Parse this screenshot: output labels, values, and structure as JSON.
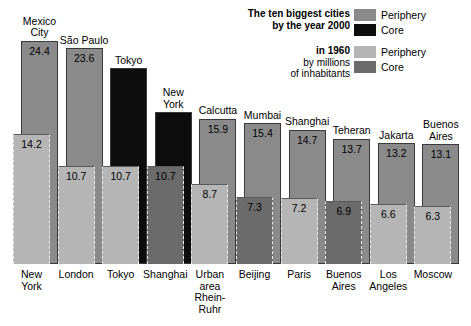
{
  "legend": {
    "title_2000_line1": "The ten biggest cities",
    "title_2000_line2": "by the year 2000",
    "title_1960_line1": "in 1960",
    "title_1960_line2": "by millions",
    "title_1960_line3": "of inhabitants",
    "periphery_2000_label": "Periphery",
    "core_2000_label": "Core",
    "periphery_1960_label": "Periphery",
    "core_1960_label": "Core",
    "colors": {
      "periphery_2000": "#8a8a8a",
      "core_2000": "#0d0d0d",
      "periphery_1960": "#b5b5b5",
      "core_1960": "#6b6b6b"
    }
  },
  "chart_data": {
    "type": "bar",
    "xlabel": "",
    "ylabel": "millions of inhabitants",
    "ylim": [
      0,
      25
    ],
    "grid": false,
    "legend_position": "top-right",
    "series": [
      {
        "name": "2000",
        "categories": [
          "Mexico City",
          "São Paulo",
          "Tokyo",
          "New York",
          "Calcutta",
          "Mumbai",
          "Shanghai",
          "Teheran",
          "Jakarta",
          "Buenos Aires"
        ],
        "values": [
          24.4,
          23.6,
          21.4,
          16.6,
          15.9,
          15.4,
          14.7,
          13.7,
          13.2,
          13.1
        ],
        "types": [
          "periphery",
          "periphery",
          "core",
          "core",
          "periphery",
          "periphery",
          "periphery",
          "periphery",
          "periphery",
          "periphery"
        ]
      },
      {
        "name": "1960",
        "categories": [
          "New York",
          "London",
          "Tokyo",
          "Shanghai",
          "Urban area Rhein-Ruhr",
          "Beijing",
          "Paris",
          "Buenos Aires",
          "Los Angeles",
          "Moscow"
        ],
        "values": [
          14.2,
          10.7,
          10.7,
          10.7,
          8.7,
          7.3,
          7.2,
          6.9,
          6.6,
          6.3
        ],
        "types": [
          "periphery",
          "periphery",
          "periphery",
          "core",
          "periphery",
          "core",
          "periphery",
          "core",
          "periphery",
          "periphery"
        ]
      }
    ],
    "columns": [
      {
        "top_city_line1": "Mexico",
        "top_city_line2": "City",
        "top_value": "24.4",
        "top_type": "periphery",
        "bottom_city_line1": "New",
        "bottom_city_line2": "York",
        "bottom_city_line3": "",
        "bottom_value": "14.2",
        "bottom_type": "periphery"
      },
      {
        "top_city_line1": "São Paulo",
        "top_city_line2": "",
        "top_value": "23.6",
        "top_type": "periphery",
        "bottom_city_line1": "London",
        "bottom_city_line2": "",
        "bottom_city_line3": "",
        "bottom_value": "10.7",
        "bottom_type": "periphery"
      },
      {
        "top_city_line1": "Tokyo",
        "top_city_line2": "",
        "top_value": "",
        "top_type": "core",
        "bottom_city_line1": "Tokyo",
        "bottom_city_line2": "",
        "bottom_city_line3": "",
        "bottom_value": "10.7",
        "bottom_type": "periphery"
      },
      {
        "top_city_line1": "New",
        "top_city_line2": "York",
        "top_value": "",
        "top_type": "core",
        "bottom_city_line1": "Shanghai",
        "bottom_city_line2": "",
        "bottom_city_line3": "",
        "bottom_value": "10.7",
        "bottom_type": "core"
      },
      {
        "top_city_line1": "Calcutta",
        "top_city_line2": "",
        "top_value": "15.9",
        "top_type": "periphery",
        "bottom_city_line1": "Urban",
        "bottom_city_line2": "area",
        "bottom_city_line3": "Rhein-Ruhr",
        "bottom_value": "8.7",
        "bottom_type": "periphery"
      },
      {
        "top_city_line1": "Mumbai",
        "top_city_line2": "",
        "top_value": "15.4",
        "top_type": "periphery",
        "bottom_city_line1": "Beijing",
        "bottom_city_line2": "",
        "bottom_city_line3": "",
        "bottom_value": "7.3",
        "bottom_type": "core"
      },
      {
        "top_city_line1": "Shanghai",
        "top_city_line2": "",
        "top_value": "14.7",
        "top_type": "periphery",
        "bottom_city_line1": "Paris",
        "bottom_city_line2": "",
        "bottom_city_line3": "",
        "bottom_value": "7.2",
        "bottom_type": "periphery"
      },
      {
        "top_city_line1": "Teheran",
        "top_city_line2": "",
        "top_value": "13.7",
        "top_type": "periphery",
        "bottom_city_line1": "Buenos",
        "bottom_city_line2": "Aires",
        "bottom_city_line3": "",
        "bottom_value": "6.9",
        "bottom_type": "core"
      },
      {
        "top_city_line1": "Jakarta",
        "top_city_line2": "",
        "top_value": "13.2",
        "top_type": "periphery",
        "bottom_city_line1": "Los",
        "bottom_city_line2": "Angeles",
        "bottom_city_line3": "",
        "bottom_value": "6.6",
        "bottom_type": "periphery"
      },
      {
        "top_city_line1": "Buenos",
        "top_city_line2": "Aires",
        "top_value": "13.1",
        "top_type": "periphery",
        "bottom_city_line1": "Moscow",
        "bottom_city_line2": "",
        "bottom_city_line3": "",
        "bottom_value": "6.3",
        "bottom_type": "periphery"
      }
    ]
  }
}
